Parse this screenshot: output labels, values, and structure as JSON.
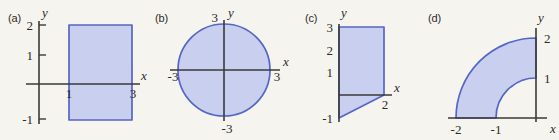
{
  "figure": {
    "background_color": "#f6f4ef",
    "region_fill_color": "#c9cfee",
    "region_stroke_color": "#5566c4",
    "axis_color": "#3a3a38",
    "text_color": "#2b2b2b"
  },
  "panels": [
    {
      "tag": "(a)",
      "x_axis_label": "x",
      "y_axis_label": "y",
      "x_ticks": [
        {
          "label": "1",
          "value": 1
        },
        {
          "label": "3",
          "value": 3
        }
      ],
      "y_ticks": [
        {
          "label": "2",
          "value": 2
        },
        {
          "label": "1",
          "value": 1
        },
        {
          "label": "-1",
          "value": -1
        }
      ],
      "shape": "rectangle",
      "description": "Rectangle spanning x from 1 to 3 and y from -1 to 2",
      "x_range": [
        1,
        3
      ],
      "y_range": [
        -1,
        2
      ]
    },
    {
      "tag": "(b)",
      "x_axis_label": "x",
      "y_axis_label": "y",
      "x_ticks": [
        {
          "label": "-3",
          "value": -3
        },
        {
          "label": "3",
          "value": 3
        }
      ],
      "y_ticks": [
        {
          "label": "3",
          "value": 3
        },
        {
          "label": "-3",
          "value": -3
        }
      ],
      "shape": "disk",
      "description": "Filled circle centered at the origin with radius 3",
      "center": [
        0,
        0
      ],
      "radius": 3
    },
    {
      "tag": "(c)",
      "x_axis_label": "x",
      "y_axis_label": "y",
      "x_ticks": [
        {
          "label": "2",
          "value": 2
        }
      ],
      "y_ticks": [
        {
          "label": "3",
          "value": 3
        },
        {
          "label": "2",
          "value": 2
        },
        {
          "label": "1",
          "value": 1
        },
        {
          "label": "-1",
          "value": -1
        }
      ],
      "shape": "trapezoid",
      "description": "Trapezoid with vertices (0,3), (2,3), (2,0) and (0,-1)",
      "vertices": [
        [
          0,
          3
        ],
        [
          2,
          3
        ],
        [
          2,
          0
        ],
        [
          0,
          -1
        ]
      ]
    },
    {
      "tag": "(d)",
      "x_axis_label": "x",
      "y_axis_label": "y",
      "x_ticks": [
        {
          "label": "-2",
          "value": -2
        },
        {
          "label": "-1",
          "value": -1
        }
      ],
      "y_ticks": [
        {
          "label": "2",
          "value": 2
        },
        {
          "label": "1",
          "value": 1
        }
      ],
      "shape": "quarter-annulus",
      "description": "Quarter annulus in the second quadrant between radius 1 and radius 2",
      "inner_radius": 1,
      "outer_radius": 2,
      "quadrant": "second"
    }
  ]
}
